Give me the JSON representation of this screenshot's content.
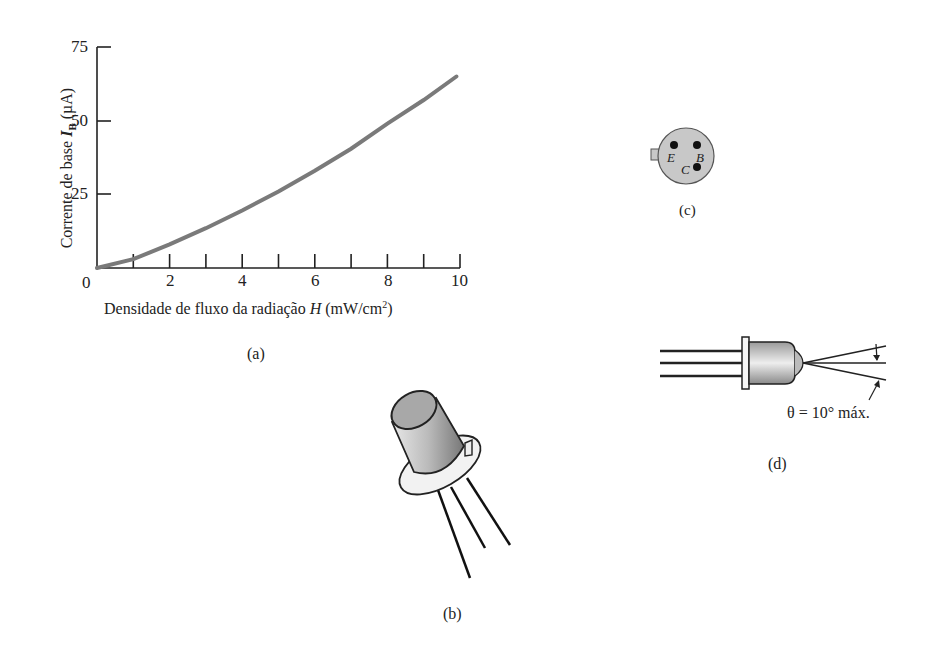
{
  "panel_a": {
    "caption": "(a)",
    "ylabel_prefix": "Corrente de base ",
    "ylabel_symbol": "I",
    "ylabel_sub": "B",
    "ylabel_unit": " (µA)",
    "xlabel_prefix": "Densidade de fluxo da radiação ",
    "xlabel_symbol": "H",
    "xlabel_unit": " (mW/cm",
    "xlabel_sup": "2",
    "xlabel_close": ")",
    "yticks": [
      "75",
      "50",
      "25"
    ],
    "xticks": [
      "0",
      "2",
      "4",
      "6",
      "8",
      "10"
    ]
  },
  "panel_b": {
    "caption": "(b)"
  },
  "panel_c": {
    "caption": "(c)",
    "pins": {
      "e": "E",
      "b": "B",
      "c": "C"
    }
  },
  "panel_d": {
    "caption": "(d)",
    "angle_label": "θ = 10° máx."
  },
  "chart_data": {
    "type": "line",
    "title": "",
    "xlabel": "Densidade de fluxo da radiação H (mW/cm²)",
    "ylabel": "Corrente de base I_B (µA)",
    "xlim": [
      0,
      10
    ],
    "ylim": [
      0,
      75
    ],
    "xticks": [
      0,
      2,
      4,
      6,
      8,
      10
    ],
    "minor_xticks": [
      1,
      3,
      5,
      7,
      9
    ],
    "yticks": [
      25,
      50,
      75
    ],
    "grid": false,
    "series": [
      {
        "name": "I_B vs H",
        "color": "#7a7a7a",
        "x": [
          0,
          1,
          2,
          3,
          4,
          5,
          6,
          7,
          8,
          9,
          9.9
        ],
        "y": [
          0,
          3,
          8,
          13.5,
          19.5,
          26,
          33,
          40.5,
          49,
          57,
          65
        ]
      }
    ]
  }
}
